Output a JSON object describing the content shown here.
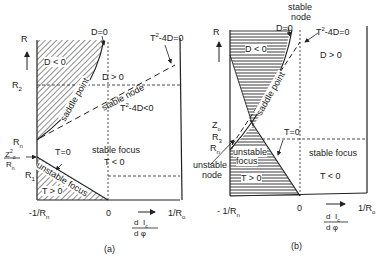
{
  "panel_a": {
    "caption": "(a)",
    "y_axis": {
      "label": "R",
      "ticks": [
        "R2",
        "Rn",
        "Z0²/Rn",
        "R1"
      ]
    },
    "x_axis": {
      "left_label": "-1/Rn",
      "zero_label": "0",
      "right_label": "1/Ro",
      "quantity_num": "d Ic",
      "quantity_den": "d φ"
    },
    "curves": {
      "d_zero": "D=0",
      "t2_4d_zero": "T²-4D=0",
      "t_zero": "T=0"
    },
    "regions": {
      "d_neg": "D < 0",
      "saddle": "saddle point",
      "d_pos": "D > 0",
      "stable_node": "stable node",
      "t2_4d_neg": "T²-4D < 0",
      "stable_focus": "stable focus",
      "t_neg": "T < 0",
      "unstable_focus": "unstable focus",
      "t_pos": "T > 0"
    }
  },
  "panel_b": {
    "caption": "(b)",
    "y_axis": {
      "label": "R",
      "ticks": [
        "Zo",
        "R3",
        "Rn"
      ]
    },
    "x_axis": {
      "left_label": "- 1/Rn",
      "zero_label": "0",
      "right_label": "1/Ro",
      "quantity_num": "d Ic",
      "quantity_den": "d φ"
    },
    "curves": {
      "d_zero": "D=0",
      "t2_4d_zero": "T²-4D=0",
      "t_zero": "T=0"
    },
    "regions": {
      "stable_node_top": "stable",
      "stable_node_bottom": "node",
      "d_neg": "D < 0",
      "d_pos": "D > 0",
      "saddle": "saddle point",
      "unstable_focus_1": "unstable",
      "unstable_focus_2": "focus",
      "t_pos": "T > 0",
      "unstable_node_1": "unstable",
      "unstable_node_2": "node",
      "stable_focus": "stable focus",
      "t_neg": "T < 0"
    }
  },
  "colors": {
    "ink": "#222222",
    "background": "#ffffff"
  }
}
